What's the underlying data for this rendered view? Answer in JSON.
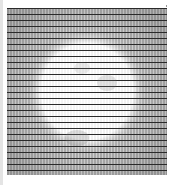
{
  "image": {
    "subject": "hatched grid pattern with light circular center",
    "colors": {
      "background": "#ffffff",
      "ink": "#3a3a3a",
      "shade": "#8a8a8a",
      "edge_strip": "#e4e4e4"
    }
  }
}
